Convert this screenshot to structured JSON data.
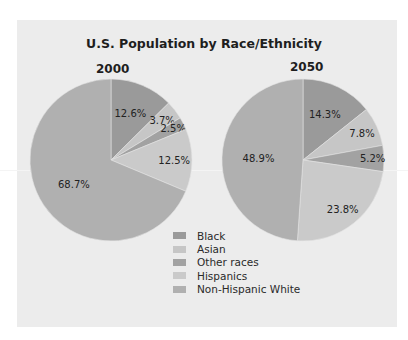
{
  "chart_data": {
    "type": "pie",
    "title": "U.S. Population by Race/Ethnicity",
    "categories": [
      "Black",
      "Asian",
      "Other races",
      "Hispanics",
      "Non-Hispanic White"
    ],
    "series": [
      {
        "name": "2000",
        "values": [
          12.6,
          3.7,
          2.5,
          12.5,
          68.7
        ],
        "labels": [
          "12.6%",
          "3.7%",
          "2.5%",
          "12.5%",
          "68.7%"
        ]
      },
      {
        "name": "2050",
        "values": [
          14.3,
          7.8,
          5.2,
          23.8,
          48.9
        ],
        "labels": [
          "14.3%",
          "7.8%",
          "5.2%",
          "23.8%",
          "48.9%"
        ]
      }
    ],
    "colors": [
      "#9a9a9a",
      "#c6c6c6",
      "#a2a2a2",
      "#cacaca",
      "#b0b0b0"
    ],
    "start_angle_deg": 0,
    "direction": "clockwise",
    "legend_position": "bottom-center"
  },
  "chart": {
    "title": "U.S. Population by Race/Ethnicity",
    "pies": [
      {
        "year": "2000"
      },
      {
        "year": "2050"
      }
    ],
    "legend": [
      {
        "label": "Black"
      },
      {
        "label": "Asian"
      },
      {
        "label": "Other races"
      },
      {
        "label": "Hispanics"
      },
      {
        "label": "Non-Hispanic White"
      }
    ]
  }
}
